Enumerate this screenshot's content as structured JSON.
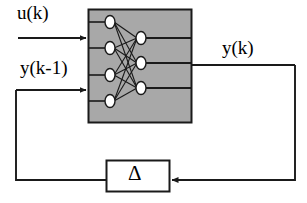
{
  "diagram": {
    "type": "block-diagram",
    "colors": {
      "network_fill": "#a8a8a8",
      "network_stroke": "#1a1a1a",
      "line": "#1a1a1a",
      "node_fill": "#ffffff",
      "node_stroke": "#1a1a1a",
      "background": "#ffffff",
      "delta_fill": "#ffffff"
    },
    "labels": {
      "input_u": "u(k)",
      "input_y_delayed": "y(k-1)",
      "output_y": "y(k)",
      "delay_block": "Δ"
    },
    "network": {
      "input_nodes": 4,
      "output_nodes": 3,
      "fully_connected": true,
      "box": {
        "x": 88,
        "y": 9,
        "width": 104,
        "height": 114
      },
      "input_node_positions": [
        {
          "cx": 110,
          "cy": 22
        },
        {
          "cx": 110,
          "cy": 48
        },
        {
          "cx": 110,
          "cy": 75
        },
        {
          "cx": 110,
          "cy": 101
        }
      ],
      "output_node_positions": [
        {
          "cx": 141,
          "cy": 38
        },
        {
          "cx": 141,
          "cy": 63
        },
        {
          "cx": 141,
          "cy": 88
        }
      ],
      "node_rx": 5,
      "node_ry": 6
    },
    "delay_block": {
      "x": 106,
      "y": 160,
      "width": 64,
      "height": 32
    },
    "signal_paths": [
      {
        "name": "u-input-arrow",
        "from": [
          18,
          38
        ],
        "to": [
          88,
          38
        ]
      },
      {
        "name": "y-delayed-input-arrow",
        "from": [
          16,
          90
        ],
        "to": [
          88,
          90
        ]
      },
      {
        "name": "y-output-line",
        "from": [
          192,
          65
        ],
        "to": [
          295,
          65
        ]
      },
      {
        "name": "feedback-right-down",
        "from": [
          295,
          65
        ],
        "to": [
          295,
          180
        ]
      },
      {
        "name": "feedback-into-delta",
        "from": [
          295,
          180
        ],
        "to": [
          170,
          180
        ]
      },
      {
        "name": "delta-out-left",
        "from": [
          106,
          180
        ],
        "to": [
          16,
          180
        ]
      },
      {
        "name": "feedback-left-up",
        "from": [
          16,
          180
        ],
        "to": [
          16,
          90
        ]
      }
    ]
  }
}
